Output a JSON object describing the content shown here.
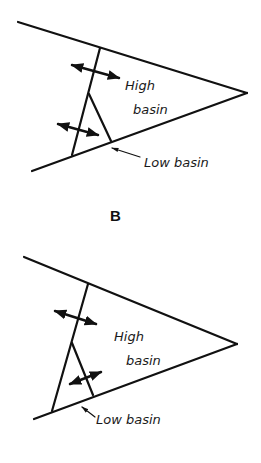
{
  "figure": {
    "panel_b_label": "B",
    "top_diagram": {
      "labels": {
        "high_line1": "High",
        "high_line2": "basin",
        "low": "Low basin"
      }
    },
    "bottom_diagram": {
      "labels": {
        "high_line1": "High",
        "high_line2": "basin",
        "low": "Low basin"
      }
    }
  },
  "colors": {
    "ink": "#111111",
    "background": "#ffffff"
  }
}
